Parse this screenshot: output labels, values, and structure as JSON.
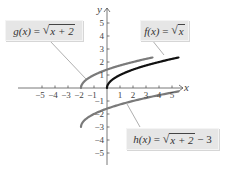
{
  "chart_data": {
    "type": "line",
    "title": "",
    "xlabel": "x",
    "ylabel": "y",
    "xlim": [
      -5.5,
      5.5
    ],
    "ylim": [
      -5.5,
      5.5
    ],
    "xticks": [
      -5,
      -4,
      -3,
      -2,
      -1,
      1,
      2,
      3,
      4,
      5
    ],
    "yticks": [
      5,
      4,
      3,
      2,
      1,
      -1,
      -2,
      -3,
      -4,
      -5
    ],
    "grid": false,
    "series": [
      {
        "name": "f(x) = √x",
        "color": "#111111",
        "domain": [
          0,
          5.5
        ],
        "x": [
          0,
          0.25,
          1,
          2,
          3,
          4,
          5
        ],
        "values": [
          0,
          0.5,
          1,
          1.414,
          1.732,
          2,
          2.236
        ]
      },
      {
        "name": "g(x) = √(x + 2)",
        "color": "#7a7a7a",
        "domain": [
          -2,
          3.5
        ],
        "x": [
          -2,
          -1,
          0,
          1,
          2,
          3
        ],
        "values": [
          0,
          1,
          1.414,
          1.732,
          2,
          2.236
        ]
      },
      {
        "name": "h(x) = √(x + 2) − 3",
        "color": "#7a7a7a",
        "domain": [
          -2,
          5.5
        ],
        "x": [
          -2,
          -1,
          0,
          1,
          2,
          3,
          4,
          5
        ],
        "values": [
          -3,
          -2,
          -1.586,
          -1.268,
          -1,
          -0.764,
          -0.551,
          -0.354
        ]
      }
    ],
    "annotations": [
      "g(x) = √(x + 2)",
      "f(x) = √x",
      "h(x) = √(x + 2) − 3"
    ]
  },
  "axes": {
    "x_label": "x",
    "y_label": "y",
    "x_ticks": [
      "−5",
      "−4",
      "−3",
      "−2",
      "−1",
      "1",
      "2",
      "3",
      "4",
      "5"
    ],
    "y_ticks": [
      "5",
      "4",
      "3",
      "2",
      "1",
      "−1",
      "−2",
      "−3",
      "−4",
      "−5"
    ]
  },
  "labels": {
    "g": {
      "name": "g(x)",
      "eq": " = ",
      "radicand": "x + 2",
      "tail": ""
    },
    "f": {
      "name": "f(x)",
      "eq": " = ",
      "radicand": "x",
      "tail": ""
    },
    "h": {
      "name": "h(x)",
      "eq": " = ",
      "radicand": "x + 2",
      "tail": " − 3"
    }
  },
  "colors": {
    "f_curve": "#111111",
    "g_curve": "#7a7a7a",
    "h_curve": "#7a7a7a",
    "label_fill": "#e6e6e6",
    "axis": "#555555"
  }
}
